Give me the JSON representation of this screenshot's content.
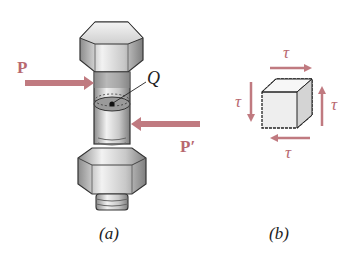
{
  "figure_a": {
    "caption": "(a)",
    "force_left_label": "P",
    "force_right_label": "P′",
    "point_label": "Q"
  },
  "figure_b": {
    "caption": "(b)",
    "shear_top": "τ",
    "shear_bottom": "τ",
    "shear_left": "τ",
    "shear_right": "τ"
  },
  "colors": {
    "arrow": "#c07a80",
    "metal_light": "#e8e8e8",
    "metal_dark": "#9a9a9a",
    "outline": "#333333"
  }
}
